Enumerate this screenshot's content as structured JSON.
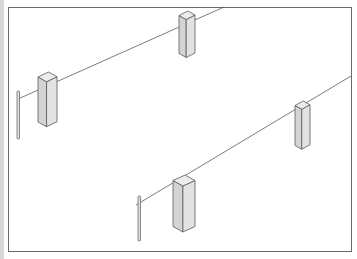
{
  "figure": {
    "kind": "isometric line illustration",
    "frame": {
      "x": 8,
      "y": 7,
      "width": 343,
      "height": 244,
      "stroke": "#6a6a6a"
    },
    "colors": {
      "line": "#5a5a5a",
      "box_front": "#e2e2e2",
      "box_side": "#d4d4d4",
      "box_top": "#ececec",
      "pole": "#e0e0e0"
    },
    "wires": [
      {
        "id": "upper-wire",
        "x1": 18,
        "y1": 99,
        "x2": 224,
        "y2": 7
      },
      {
        "id": "lower-wire",
        "x1": 136,
        "y1": 205,
        "x2": 351,
        "y2": 76
      }
    ],
    "poles": [
      {
        "id": "upper-pole",
        "x": 18,
        "top": 91,
        "bottom": 139
      },
      {
        "id": "lower-pole",
        "x": 139,
        "top": 196,
        "bottom": 241
      }
    ],
    "boxes": [
      {
        "id": "box-upper-left",
        "x": 38,
        "y": 72,
        "w": 19,
        "h": 45,
        "d": 10
      },
      {
        "id": "box-upper-middle",
        "x": 179,
        "y": 11,
        "w": 16,
        "h": 38,
        "d": 9
      },
      {
        "id": "box-right",
        "x": 295,
        "y": 101,
        "w": 15,
        "h": 40,
        "d": 9
      },
      {
        "id": "box-lower-middle",
        "x": 173,
        "y": 175,
        "w": 22,
        "h": 46,
        "d": 11
      }
    ]
  }
}
